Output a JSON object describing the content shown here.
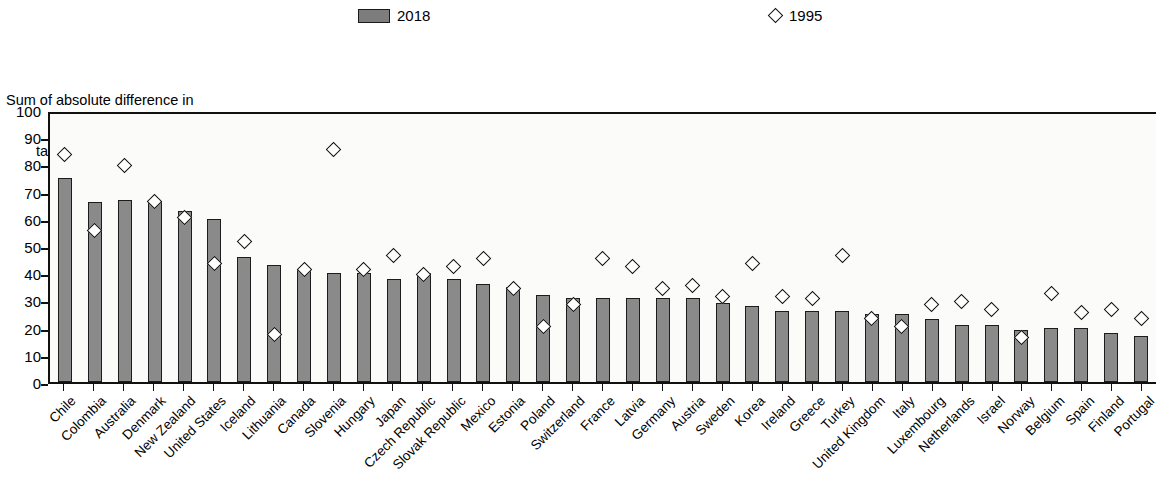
{
  "legend": {
    "items": [
      {
        "key": "bar-2018",
        "label": "2018",
        "marker": "filled-rect",
        "color": "#8a8a8a"
      },
      {
        "key": "marker-1995",
        "label": "1995",
        "marker": "open-diamond",
        "color": "#ffffff"
      }
    ]
  },
  "axis_title": {
    "line1": "Sum of absolute difference in",
    "line2": "tax structures"
  },
  "y_axis": {
    "ticks": [
      "100",
      "90",
      "80",
      "70",
      "60",
      "50",
      "40",
      "30",
      "20",
      "10",
      "0"
    ]
  },
  "chart_data": {
    "type": "bar",
    "title": "Sum of absolute difference in tax structures",
    "xlabel": "",
    "ylabel": "Sum of absolute difference in tax structures",
    "ylim": [
      0,
      100
    ],
    "ytick_step": 10,
    "grid": false,
    "legend_position": "top",
    "categories": [
      "Chile",
      "Colombia",
      "Australia",
      "Denmark",
      "New Zealand",
      "United States",
      "Iceland",
      "Lithuania",
      "Canada",
      "Slovenia",
      "Hungary",
      "Japan",
      "Czech Republic",
      "Slovak Republic",
      "Mexico",
      "Estonia",
      "Poland",
      "Switzerland",
      "France",
      "Latvia",
      "Germany",
      "Austria",
      "Sweden",
      "Korea",
      "Ireland",
      "Greece",
      "Turkey",
      "United Kingdom",
      "Italy",
      "Luxembourg",
      "Netherlands",
      "Israel",
      "Norway",
      "Belgium",
      "Spain",
      "Finland",
      "Portugal"
    ],
    "series": [
      {
        "name": "2018",
        "type": "bar",
        "color": "#8a8a8a",
        "values": [
          75,
          66,
          67,
          66,
          63,
          60,
          46,
          43,
          41,
          40,
          40,
          38,
          40,
          38,
          36,
          35,
          32,
          31,
          31,
          31,
          31,
          31,
          29,
          28,
          26,
          26,
          26,
          25,
          25,
          23,
          21,
          21,
          19,
          20,
          20,
          18,
          17
        ]
      },
      {
        "name": "1995",
        "type": "scatter",
        "marker": "open-diamond",
        "values": [
          85,
          57,
          81,
          68,
          62,
          45,
          53,
          19,
          43,
          87,
          43,
          48,
          41,
          44,
          47,
          36,
          22,
          30,
          47,
          44,
          36,
          37,
          33,
          45,
          33,
          32,
          48,
          25,
          22,
          30,
          31,
          28,
          18,
          34,
          27,
          28,
          25
        ]
      }
    ]
  }
}
